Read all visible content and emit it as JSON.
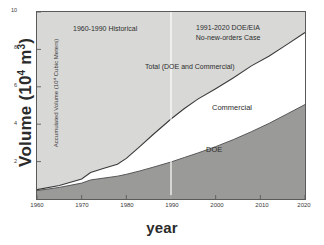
{
  "chart_data": {
    "type": "area",
    "title": "",
    "subtitle": "",
    "xlabel": "year",
    "ylabel": "Volume (10^4 m^3)",
    "ylabel_inner": "Accumulated Volume (10⁴ Cubic Meters)",
    "ylabel_main_text": "Volume (10",
    "ylabel_main_exp": "4",
    "ylabel_main_tail": " m",
    "ylabel_main_exp2": "3",
    "ylabel_main_close": ")",
    "stacked": true,
    "grid": false,
    "legend_position": "inline-annotations",
    "xlim": [
      1960,
      2020
    ],
    "ylim": [
      0,
      10
    ],
    "xticks": [
      1960,
      1970,
      1980,
      1990,
      2000,
      2010,
      2020
    ],
    "xtick_labels": [
      "1960",
      "1970",
      "1980",
      "1990",
      "2000",
      "2010",
      "2020"
    ],
    "yticks": [
      2,
      4,
      6,
      8,
      10
    ],
    "ytick_labels": [
      "2",
      "4",
      "6",
      "8",
      "10"
    ],
    "x": [
      1960,
      1965,
      1970,
      1972,
      1975,
      1978,
      1980,
      1983,
      1986,
      1990,
      1993,
      1996,
      2000,
      2004,
      2008,
      2012,
      2016,
      2020
    ],
    "series": [
      {
        "name": "DOE",
        "label": "DOE",
        "color": "#9a9a98",
        "values": [
          0.45,
          0.62,
          0.85,
          1.02,
          1.12,
          1.22,
          1.32,
          1.5,
          1.7,
          1.98,
          2.22,
          2.46,
          2.8,
          3.18,
          3.6,
          4.05,
          4.55,
          5.05
        ]
      },
      {
        "name": "Commercial",
        "label": "Commercial",
        "color": "#ffffff",
        "values": [
          0.05,
          0.1,
          0.22,
          0.4,
          0.52,
          0.64,
          0.85,
          1.3,
          1.75,
          2.3,
          2.62,
          2.88,
          3.1,
          3.3,
          3.52,
          3.6,
          3.72,
          3.85
        ]
      }
    ],
    "total": {
      "name": "Total (DOE and Commercial)",
      "label": "Total (DOE and Commercial)",
      "values": [
        0.5,
        0.72,
        1.07,
        1.42,
        1.64,
        1.86,
        2.17,
        2.8,
        3.45,
        4.28,
        4.84,
        5.34,
        5.9,
        6.48,
        7.12,
        7.65,
        8.27,
        8.9
      ]
    },
    "annotations": [
      {
        "name": "historical-period",
        "text": "1960-1990 Historical",
        "x": 1972,
        "y": 9.3
      },
      {
        "name": "forecast-period-line1",
        "text": "1991-2020 DOE/EIA",
        "x": 2000,
        "y": 9.4
      },
      {
        "name": "forecast-period-line2",
        "text": "No-new-orders Case",
        "x": 2000,
        "y": 8.8
      },
      {
        "name": "total-curve-label",
        "text": "Total (DOE and Commercial)",
        "x": 1995,
        "y": 7.2
      },
      {
        "name": "commercial-band-label",
        "text": "Commercial",
        "x": 2005,
        "y": 5.0
      },
      {
        "name": "doe-band-label",
        "text": "DOE",
        "x": 2005,
        "y": 2.8
      }
    ],
    "divider": {
      "name": "historical-forecast-divider",
      "x": 1990,
      "color": "#ffffff"
    },
    "colors": {
      "plot_background": "#d8d8d6",
      "doe_fill": "#9a9a98",
      "commercial_fill": "#ffffff",
      "axis": "#5a5a5a",
      "text": "#2d2d2d"
    }
  }
}
